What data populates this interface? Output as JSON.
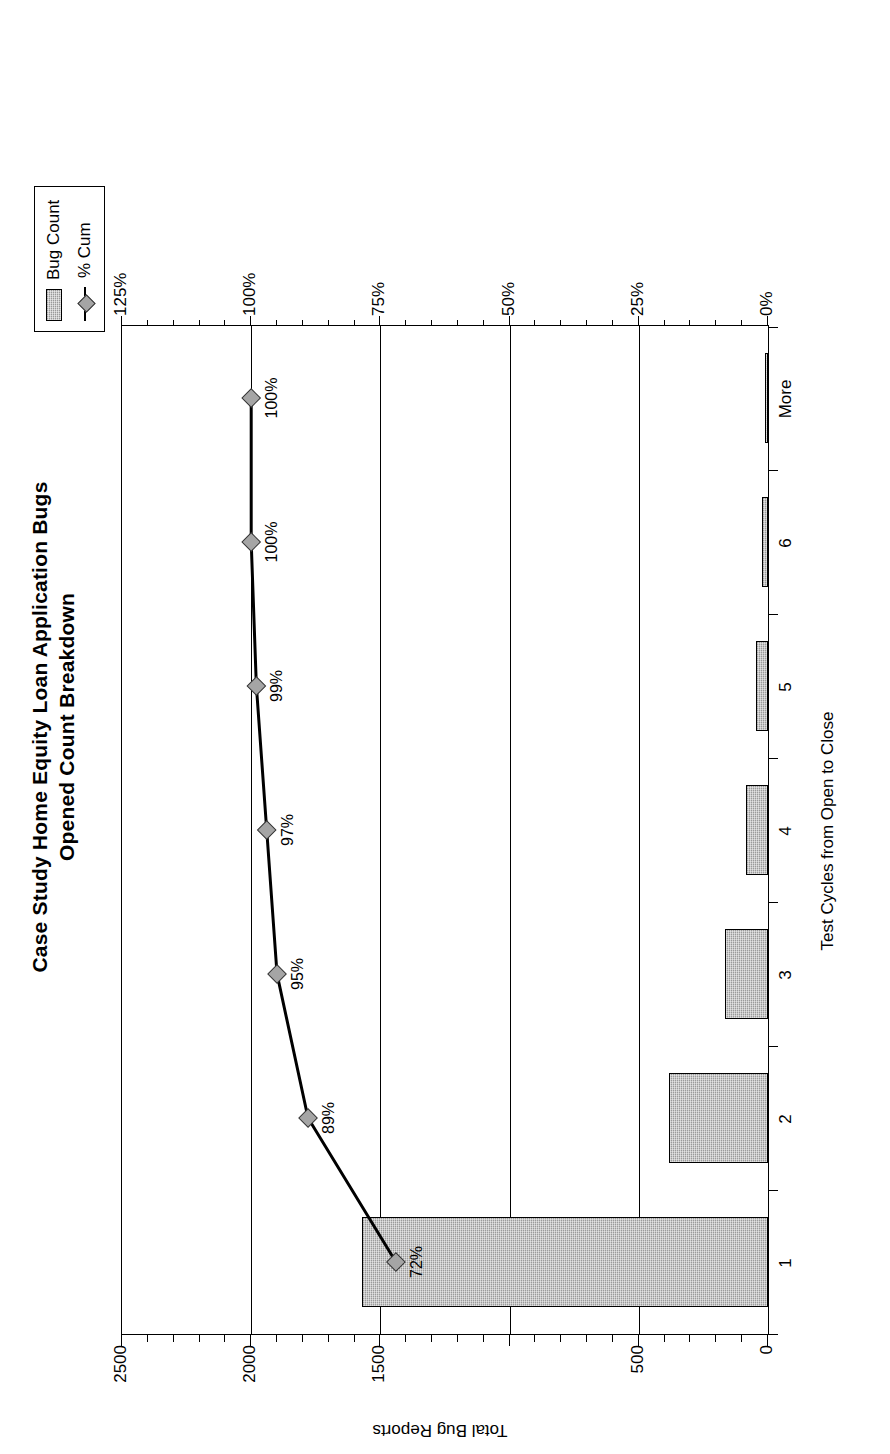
{
  "title": {
    "line1": "Case Study Home Equity Loan Application Bugs",
    "line2": "Opened Count Breakdown"
  },
  "legend": {
    "position": "top-right",
    "items": [
      {
        "label": "Bug Count",
        "marker": "bar-swatch",
        "color": "#9a9a9a"
      },
      {
        "label": "% Cum",
        "marker": "line-diamond",
        "color": "#000000"
      }
    ]
  },
  "axes": {
    "x_title": "Test Cycles from Open to Close",
    "y_left_title": "Total Bug Reports",
    "y_left_ticks": [
      "0",
      "500",
      "",
      "1500",
      "2000",
      "2500"
    ],
    "y_right_ticks": [
      "0%",
      "25%",
      "50%",
      "75%",
      "100%",
      "125%"
    ]
  },
  "chart_data": {
    "type": "bar",
    "title": "Case Study Home Equity Loan Application Bugs Opened Count Breakdown",
    "xlabel": "Test Cycles from Open to Close",
    "ylabel": "Total Bug Reports",
    "categories": [
      "1",
      "2",
      "3",
      "4",
      "5",
      "6",
      "More"
    ],
    "ylim": [
      0,
      2500
    ],
    "y2lim": [
      0,
      125
    ],
    "y2label": "% Cum",
    "grid": true,
    "legend_position": "top-right",
    "series": [
      {
        "name": "Bug Count",
        "type": "bar",
        "axis": "left",
        "values": [
          1570,
          385,
          165,
          85,
          45,
          25,
          10
        ]
      },
      {
        "name": "% Cum",
        "type": "line",
        "axis": "right",
        "values": [
          72,
          89,
          95,
          97,
          99,
          100,
          100
        ],
        "data_labels": [
          "72%",
          "89%",
          "95%",
          "97%",
          "99%",
          "100%",
          "100%"
        ]
      }
    ]
  }
}
